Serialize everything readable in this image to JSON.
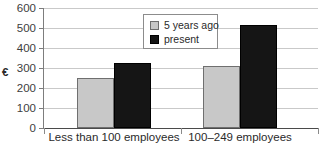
{
  "chart_data": {
    "type": "bar",
    "title": "to small businesses",
    "xlabel": "",
    "ylabel": "€",
    "ylim": [
      0,
      600
    ],
    "yticks": [
      0,
      100,
      200,
      300,
      400,
      500,
      600
    ],
    "ytick_labels": [
      "0",
      "100",
      "200",
      "300",
      "400",
      "500",
      "600"
    ],
    "grid": true,
    "legend_position": "upper center",
    "categories": [
      "Less than 100 employees",
      "100–249 employees"
    ],
    "series": [
      {
        "name": "5 years ago",
        "color": "#c8c8c8",
        "values": [
          250,
          310
        ]
      },
      {
        "name": "present",
        "color": "#151515",
        "values": [
          325,
          515
        ]
      }
    ]
  },
  "legend": {
    "items": [
      {
        "label": "5 years ago"
      },
      {
        "label": "present"
      }
    ]
  },
  "colors": {
    "series_past": "#c8c8c8",
    "series_present": "#151515",
    "gridline": "#c9c9c9",
    "axis": "#4a4a4a",
    "background": "#ffffff"
  }
}
